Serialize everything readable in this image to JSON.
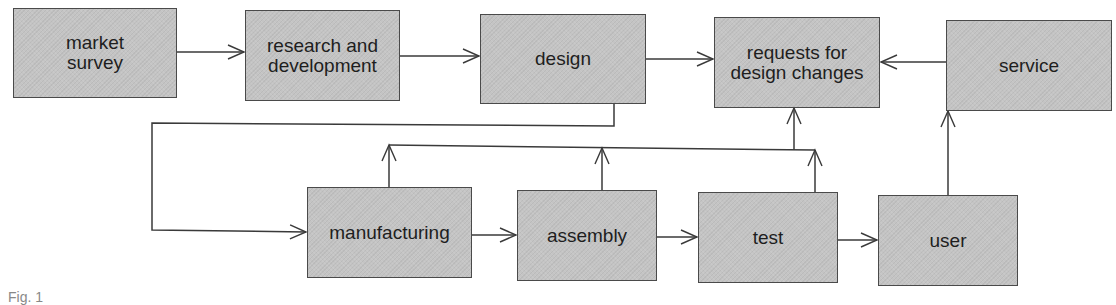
{
  "diagram": {
    "type": "flowchart",
    "colors": {
      "box_fill": "#c4c4c4",
      "box_border": "#4a4a4a",
      "line": "#3a3a3a",
      "text": "#1e1e1e"
    },
    "nodes": {
      "market_survey": "market\nsurvey",
      "research_and_development": "research and\ndevelopment",
      "design": "design",
      "requests_for_design_changes": "requests for\ndesign changes",
      "service": "service",
      "manufacturing": "manufacturing",
      "assembly": "assembly",
      "test": "test",
      "user": "user"
    },
    "edges": [
      {
        "from": "market survey",
        "to": "research and development"
      },
      {
        "from": "research and development",
        "to": "design"
      },
      {
        "from": "design",
        "to": "requests for design changes"
      },
      {
        "from": "service",
        "to": "requests for design changes"
      },
      {
        "from": "design",
        "to": "manufacturing"
      },
      {
        "from": "manufacturing",
        "to": "assembly"
      },
      {
        "from": "assembly",
        "to": "test"
      },
      {
        "from": "test",
        "to": "user"
      },
      {
        "from": "user",
        "to": "service"
      },
      {
        "from": "manufacturing",
        "to": "requests for design changes"
      },
      {
        "from": "assembly",
        "to": "requests for design changes"
      },
      {
        "from": "test",
        "to": "requests for design changes"
      }
    ],
    "caption": "Fig. 1"
  }
}
